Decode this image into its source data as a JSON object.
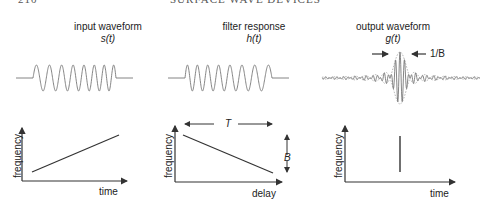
{
  "header": {
    "page_number": "210",
    "running_title": "SURFACE WAVE DEVICES"
  },
  "panels": [
    {
      "title": "input waveform",
      "symbol": "s(t)",
      "xlabel": "time",
      "ylabel": "frequency",
      "plot": "increasing-line"
    },
    {
      "title": "filter response",
      "symbol": "h(t)",
      "xlabel": "delay",
      "ylabel": "frequency",
      "plot": "decreasing-line",
      "annotations": {
        "width": "T",
        "height": "B"
      }
    },
    {
      "title": "output waveform",
      "symbol": "g(t)",
      "xlabel": "time",
      "ylabel": "frequency",
      "plot": "vertical-line",
      "annotations": {
        "pulse_width": "1/B"
      }
    }
  ],
  "colors": {
    "stroke": "#333333",
    "waveform": "#777777"
  }
}
